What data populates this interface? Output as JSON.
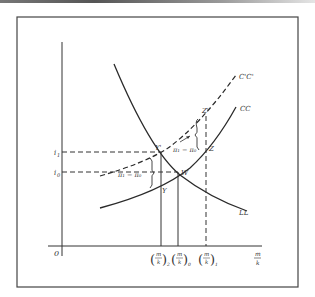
{
  "diagram": {
    "type": "economics-equilibrium-diagram",
    "axes": {
      "origin_label": "0",
      "x_label_num": "m",
      "x_label_den": "k",
      "y_ticks": [
        {
          "label": "i",
          "sub": "1",
          "y": 152
        },
        {
          "label": "i",
          "sub": "0",
          "y": 172
        }
      ],
      "x_ticks": [
        {
          "num": "m",
          "den": "k",
          "sub": "2",
          "x": 161
        },
        {
          "num": "m",
          "den": "k",
          "sub": "0",
          "x": 178
        },
        {
          "num": "m",
          "den": "k",
          "sub": "1",
          "x": 206
        }
      ]
    },
    "curves": [
      {
        "name": "LL",
        "label": "LL",
        "style": "solid"
      },
      {
        "name": "CC",
        "label": "CC",
        "style": "solid"
      },
      {
        "name": "C'C'",
        "label": "C'C'",
        "style": "dashed"
      }
    ],
    "points": [
      {
        "label": "Y'",
        "x": 161,
        "y": 152
      },
      {
        "label": "W",
        "x": 178,
        "y": 172
      },
      {
        "label": "Y",
        "x": 161,
        "y": 186
      },
      {
        "label": "Z",
        "x": 206,
        "y": 150
      },
      {
        "label": "Z'",
        "x": 206,
        "y": 116
      }
    ],
    "annotations": [
      {
        "text": "π₁ − π₀",
        "position": "right-upper"
      },
      {
        "text": "π₁ − π₀",
        "position": "left-lower"
      }
    ],
    "colors": {
      "line": "#2a2a2a",
      "frame": "#444444",
      "text": "#333333"
    }
  }
}
